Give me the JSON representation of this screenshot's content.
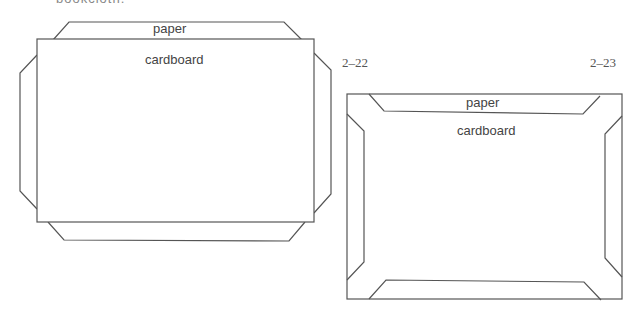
{
  "header": {
    "clipped_text": "bookcloth."
  },
  "figures": [
    {
      "id": "2-22",
      "number_label": "2–22",
      "labels": {
        "paper": "paper",
        "cardboard": "cardboard"
      }
    },
    {
      "id": "2-23",
      "number_label": "2–23",
      "labels": {
        "paper": "paper",
        "cardboard": "cardboard"
      }
    }
  ],
  "colors": {
    "line": "#555555",
    "text": "#444444",
    "background": "#ffffff"
  }
}
